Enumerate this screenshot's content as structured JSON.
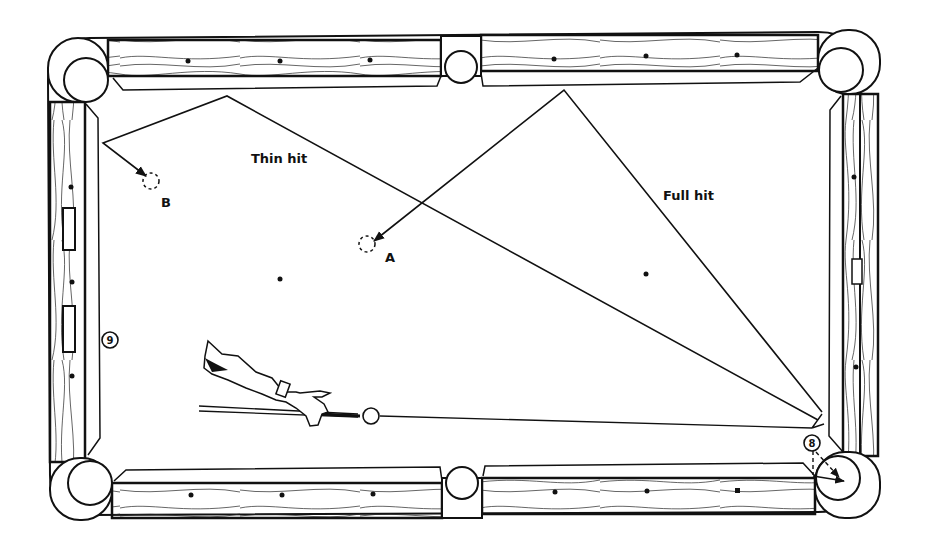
{
  "diagram": {
    "labels": {
      "thin_hit": "Thin hit",
      "full_hit": "Full hit",
      "position_a": "A",
      "position_b": "B"
    },
    "balls": {
      "nine": "9",
      "eight": "8"
    },
    "paths": [
      {
        "name": "thin-hit-path",
        "label": "Thin hit",
        "ends_at": "B"
      },
      {
        "name": "full-hit-path",
        "label": "Full hit",
        "ends_at": "A"
      },
      {
        "name": "cue-ball-path",
        "label": "",
        "ends_at": "8"
      }
    ],
    "colors": {
      "line": "#111111",
      "background": "#ffffff"
    }
  }
}
